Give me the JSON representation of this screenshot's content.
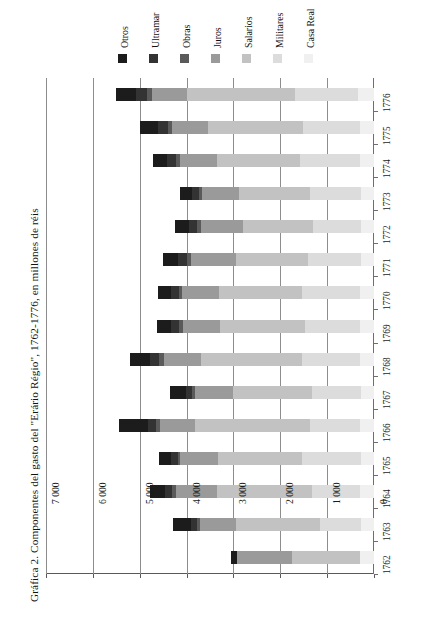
{
  "chart_data": {
    "type": "bar",
    "orientation": "horizontal-stacked",
    "title": "Gráfica 2. Componentes del gasto del \"Erário Régio\", 1762-1776, en millones de réis",
    "xlabel": "",
    "ylabel": "",
    "xlim": [
      0,
      7000
    ],
    "xticks": [
      "0",
      "1 000",
      "2 000",
      "3 000",
      "4 000",
      "5 000",
      "6 000",
      "7 000"
    ],
    "xtick_values": [
      0,
      1000,
      2000,
      3000,
      4000,
      5000,
      6000,
      7000
    ],
    "grid": true,
    "legend_position": "top",
    "categories": [
      "1762",
      "1763",
      "1764",
      "1765",
      "1766",
      "1767",
      "1768",
      "1769",
      "1770",
      "1771",
      "1772",
      "1773",
      "1774",
      "1775",
      "1776"
    ],
    "series": [
      {
        "name": "Otros",
        "color": "#1c1c1c",
        "values": [
          130,
          390,
          330,
          260,
          610,
          340,
          420,
          300,
          290,
          320,
          300,
          250,
          300,
          400,
          430
        ]
      },
      {
        "name": "Ultramar",
        "color": "#333333",
        "values": [
          0,
          130,
          150,
          140,
          180,
          140,
          210,
          180,
          170,
          200,
          180,
          150,
          200,
          210,
          230
        ]
      },
      {
        "name": "Obras",
        "color": "#5a5a5a",
        "values": [
          0,
          60,
          70,
          60,
          80,
          70,
          90,
          80,
          70,
          90,
          80,
          70,
          90,
          90,
          100
        ]
      },
      {
        "name": "Juros",
        "color": "#9a9a9a",
        "values": [
          1180,
          780,
          870,
          800,
          760,
          800,
          800,
          790,
          780,
          950,
          900,
          780,
          780,
          760,
          760
        ]
      },
      {
        "name": "Salarios",
        "color": "#c2c2c2",
        "values": [
          1450,
          1780,
          2030,
          1790,
          2450,
          1680,
          2160,
          1820,
          1780,
          1540,
          1480,
          1510,
          1780,
          2030,
          2300
        ]
      },
      {
        "name": "Militares",
        "color": "#dcdcdc",
        "values": [
          0,
          880,
          1030,
          1260,
          1070,
          1050,
          1230,
          1180,
          1240,
          1130,
          1040,
          1090,
          1270,
          1210,
          1350
        ]
      },
      {
        "name": "Casa Real",
        "color": "#f0f0f0",
        "values": [
          290,
          280,
          300,
          280,
          290,
          280,
          300,
          290,
          290,
          280,
          270,
          280,
          300,
          300,
          330
        ]
      }
    ],
    "totals": [
      3050,
      4300,
      4780,
      4590,
      5440,
      4360,
      5210,
      4640,
      4620,
      4510,
      4250,
      4130,
      4720,
      5000,
      5500
    ]
  },
  "legend": {
    "items": [
      {
        "label": "Otros"
      },
      {
        "label": "Ultramar"
      },
      {
        "label": "Obras"
      },
      {
        "label": "Juros"
      },
      {
        "label": "Salarios"
      },
      {
        "label": "Militares"
      },
      {
        "label": "Casa Real"
      }
    ]
  }
}
